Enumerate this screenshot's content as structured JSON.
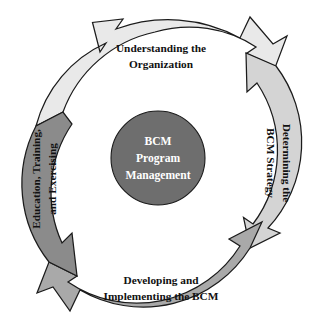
{
  "diagram": {
    "type": "cyclic-process",
    "center": {
      "name": "bcm-program-management",
      "lines": [
        "BCM",
        "Program",
        "Management"
      ],
      "fill": "#6e6e6e",
      "text_color": "#ffffff"
    },
    "segments": [
      {
        "id": "understanding-the-organization",
        "position": "top",
        "lines": [
          "Understanding the",
          "Organization"
        ],
        "fill": "#e9e9e9",
        "order": 1
      },
      {
        "id": "determining-the-bcm-strategy",
        "position": "right",
        "lines": [
          "Determining the",
          "BCM Strategy"
        ],
        "fill": "#d4d4d4",
        "order": 2
      },
      {
        "id": "developing-and-implementing-the-bcm",
        "position": "bottom",
        "lines": [
          "Developing and",
          "Implementing the BCM"
        ],
        "fill": "#a9a9a9",
        "order": 3
      },
      {
        "id": "education-training-and-exercising",
        "position": "left",
        "lines": [
          "Education, Training,",
          "and Exercising"
        ],
        "fill": "#8b8b8b",
        "order": 4
      }
    ],
    "colors": {
      "outline": "#1b1b1b",
      "background": "#ffffff",
      "hub": "#6e6e6e"
    }
  }
}
